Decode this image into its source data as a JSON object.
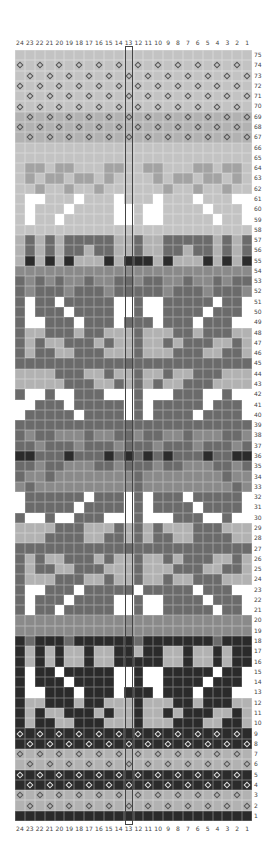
{
  "chart": {
    "title": "",
    "columns": 24,
    "rows": 75,
    "column_labels": [
      "24",
      "23",
      "22",
      "21",
      "20",
      "19",
      "18",
      "17",
      "16",
      "15",
      "14",
      "13",
      "12",
      "11",
      "10",
      "9",
      "8",
      "7",
      "6",
      "5",
      "4",
      "3",
      "2",
      "1"
    ],
    "row_labels_top_to_bottom": [
      "75",
      "74",
      "73",
      "72",
      "71",
      "70",
      "69",
      "68",
      "67",
      "66",
      "65",
      "64",
      "63",
      "62",
      "61",
      "60",
      "59",
      "58",
      "57",
      "56",
      "55",
      "54",
      "53",
      "52",
      "51",
      "50",
      "49",
      "48",
      "47",
      "46",
      "45",
      "44",
      "43",
      "42",
      "41",
      "40",
      "39",
      "38",
      "37",
      "36",
      "35",
      "34",
      "33",
      "32",
      "31",
      "30",
      "29",
      "28",
      "27",
      "26",
      "25",
      "24",
      "23",
      "22",
      "21",
      "20",
      "19",
      "18",
      "17",
      "16",
      "15",
      "14",
      "13",
      "12",
      "11",
      "10",
      "9",
      "8",
      "7",
      "6",
      "5",
      "4",
      "3",
      "2",
      "1"
    ],
    "highlighted_column": "12",
    "colors": {
      "G": "#c3c3c3",
      "L": "#b2b2b2",
      "A": "#a3a3a3",
      "M": "#8a8a8a",
      "D": "#6b6b6b",
      "K": "#2b2b2b",
      "W": "#ffffff"
    },
    "legend": {
      "diamond": "contrast stitch symbol"
    },
    "grid_rows": [
      "GGGGGGGGGGGGGGGGGGGGGGGG",
      "GGGGGGGGGGGGGGGGGGGGGGGG",
      "GGGGGGGGGGGGGGGGGGGGGGGG",
      "GGGGGGGGGGGGGGGGGGGGGGGG",
      "GGGGGGGGGGGGGGGGGGGGGGGG",
      "GGGGGGGGGGGGGGGGGGGGGGGG",
      "LLLLLLLLLLLLLLLLLLLLLLLL",
      "LLLLLLLLLLLLLLLLLLLLLLLL",
      "LLLLLLLLLLLLLLLLLLLLLLLL",
      "GGGGGGGGGGGGGGGGGGGGGGGG",
      "GGGGGGGGGGGGGGGGGGGGGGGG",
      "GAAGAAGGGAAGGAAGGGAAGAAG",
      "GAGAAGAAGAGGGGAGAAGAAGAG",
      "GGAGGAGGAGGGGGGAGGAGGAGG",
      "GWWGGGWGGGWGGGWGGGWGGGWW",
      "GWGGGWGGGGWWGWWGGGGWGGGW",
      "GWGGWGGGGGWWGWWGGGGGWGGW",
      "GGGGGGGGGGGGGGGGGGGGGGGG",
      "LDLDLDDDDDLLDLLDDDDDLDLD",
      "LDLDLDDLDDLLDLLDDLDDLDLD",
      "LKLKLKLLLKLKKKLKLLLKLKLK",
      "MMMMMMMMMMMMMMMMMMMMMMMM",
      "DMDMDMMDMMDDMDDMMDMMDMDD",
      "DMDDDMDDDMDDDDDMDDDMDDDM",
      "DWDDWDDDDDWWDWWDDDDDWDDW",
      "DWDDDWDDDDWWDWWDDDDWDDDW",
      "DWWDDDWDDDWDDDWDDDWDDDWW",
      "DLLDDDLDDLLLDLLLDDLDDDLL",
      "DLDLLDDDLDLLDLLDLDDDLLDL",
      "DLDDLLDDDLLLDLLLDDDLLDDL",
      "DDDDDDDDDDDDDDDDDDDDDDDD",
      "LLLLDDDLLDLLDLLDLLDDDLLL",
      "LLLLLDDDLLDLDLDLLDDDLLLL",
      "DWWDWWDDDWWWDWWWDDDWWDWW",
      "WWDDDWDDDDDWDWDDDDDWDDDW",
      "WDDDDDWDDDDWDWDDDDWDDDDW",
      "DDDDDDDDDDDDDDDDDDDDDDDD",
      "DMDDMMMDMMDDMDDMMDMMMDDM",
      "DDMDDDMDDDMDDDMDDDMDDDMD",
      "KKDDDKDDDKDKDKDKDDDKDDKK",
      "DDMDDMMMDDMDDDMDDMMMDDMD",
      "DMMDMMMMMMMMDMMMMMMMMDMM",
      "MDMMMMMMMMMMDMMMMMMMMMDM",
      "WDDDDDDWDDDWDWDDDWDDDDDW",
      "WDDDDDWDDDDWDWDDDDWDDDDW",
      "DWWDWWDDDWWWDWWWDDDWWDWW",
      "LLLLDDDLLLDLDLDLLLDDDLLL",
      "LLLDDDDLLDDLDLDDLLDDDDLL",
      "DDDDDDDDDDDDDDDDDDDDDDDD",
      "DLDLLDDDLDLLDLLDLDDDLLDL",
      "DLDDLLDDDLLLDLLLDDDLLDDL",
      "DLLLDDDLLDLLDLLDLLDDDLLL",
      "DWWDDDWDDDDDWDDDDDWDDDWW",
      "DWDDDWDDDDWWDWWDDDDWDDDW",
      "DWDDWDDDDDWWDWWDDDDDWDDW",
      "MMMMMMMMMMMMMMMMMMMMMMMM",
      "MMMMMMMMMMMMMMMMMMMMMMMM",
      "KDKKKDKKKKKKDKKKKKKKDKKK",
      "KLKLKLLKLLKKLKKLLKLLKLKK",
      "KLKLKLLKLLKKKKKLLKLLKLKK",
      "KWKKWKKKKKWWKWWKKKKKWKKW",
      "KWKKKWKKKKWWKWWKKKKWKKKW",
      "KWWKKKWKKKWKKKWKKKWKKKWW",
      "KLLKKKLKKLLLKLLLKKLKKKLL",
      "KLKLLKKKLKLLKLLKLKKKLLKL",
      "KLKKLLKKKLLLKLLLKKKLLKKL",
      "KKKKKKKKKKKKKKKKKKKKKKKK",
      "KKKKKKKKKKKKKKKKKKKKKKKK",
      "LLLLLLLLLLLLLLLLLLLLLLLL",
      "LLLLLLLLLLLLLLLLLLLLLLLL",
      "KKKKKKKKKKKKKKKKKKKKKKKK",
      "KKKKKKKKKKKKKKKKKKKKKKKK",
      "LLLLLLLLLLLLLLLLLLLLLLLL",
      "LLLLLLLLLLLLLLLLLLLLLLLL",
      "KKKKKKKKKKKKKKKKKKKKKKKK",
      "KKKKKKKKKKKKKKKKKKKKKKKK",
      "KKKKKKKKKKKKKKKKKKKKKKKK"
    ],
    "diamond_rows": {
      "74": "even",
      "73": "odd",
      "72": "even",
      "71": "odd",
      "70": "even",
      "69": "odd",
      "68": "even",
      "67": "odd",
      "9": "even",
      "8": "odd",
      "7": "even",
      "6": "odd",
      "5": "even",
      "4": "odd",
      "3": "even",
      "2": "odd"
    }
  }
}
